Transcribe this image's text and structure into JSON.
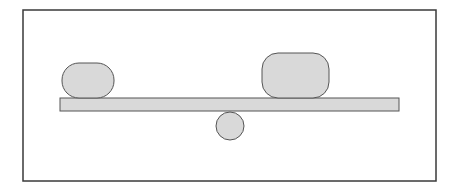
{
  "diagram": {
    "type": "seesaw-balance",
    "colors": {
      "background": "#ffffff",
      "frame_stroke": "#3a3a3a",
      "shape_fill": "#d9d9d9",
      "shape_stroke": "#555555"
    },
    "frame": {
      "x": 23,
      "y": 10,
      "width": 413,
      "height": 171
    },
    "beam": {
      "x": 60,
      "y": 98,
      "width": 339,
      "height": 13
    },
    "fulcrum": {
      "cx": 230,
      "cy": 126,
      "r": 14
    },
    "left_weight": {
      "x": 62,
      "y": 63,
      "width": 52,
      "height": 35,
      "rx": 17
    },
    "right_weight": {
      "x": 262,
      "y": 53,
      "width": 67,
      "height": 45,
      "rx": 16
    }
  }
}
